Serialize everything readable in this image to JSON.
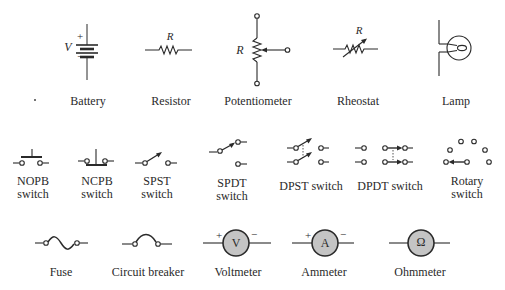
{
  "colors": {
    "stroke": "#2a2a2a",
    "meter_fill": "#c4c4c4",
    "background": "#ffffff"
  },
  "rows": [
    {
      "symbols": [
        {
          "id": "battery",
          "label": "Battery",
          "annotations": {
            "voltage": "V",
            "plus": "+",
            "minus": "−"
          }
        },
        {
          "id": "resistor",
          "label": "Resistor",
          "annotations": {
            "value": "R"
          }
        },
        {
          "id": "potentiometer",
          "label": "Potentiometer",
          "annotations": {
            "value": "R"
          }
        },
        {
          "id": "rheostat",
          "label": "Rheostat",
          "annotations": {
            "value": "R"
          }
        },
        {
          "id": "lamp",
          "label": "Lamp"
        }
      ]
    },
    {
      "symbols": [
        {
          "id": "nopb",
          "label_line1": "NOPB",
          "label_line2": "switch"
        },
        {
          "id": "ncpb",
          "label_line1": "NCPB",
          "label_line2": "switch"
        },
        {
          "id": "spst",
          "label_line1": "SPST",
          "label_line2": "switch"
        },
        {
          "id": "spdt",
          "label_line1": "SPDT",
          "label_line2": "switch"
        },
        {
          "id": "dpst",
          "label": "DPST switch"
        },
        {
          "id": "dpdt",
          "label": "DPDT switch"
        },
        {
          "id": "rotary",
          "label_line1": "Rotary",
          "label_line2": "switch"
        }
      ]
    },
    {
      "symbols": [
        {
          "id": "fuse",
          "label": "Fuse"
        },
        {
          "id": "circuit_breaker",
          "label": "Circuit breaker"
        },
        {
          "id": "voltmeter",
          "label": "Voltmeter",
          "annotations": {
            "glyph": "V",
            "plus": "+",
            "minus": "−"
          }
        },
        {
          "id": "ammeter",
          "label": "Ammeter",
          "annotations": {
            "glyph": "A",
            "plus": "+",
            "minus": "−"
          }
        },
        {
          "id": "ohmmeter",
          "label": "Ohmmeter",
          "annotations": {
            "glyph": "Ω"
          }
        }
      ]
    }
  ]
}
